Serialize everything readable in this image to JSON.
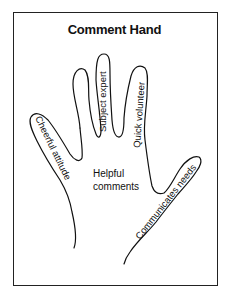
{
  "title": "Comment Hand",
  "palm_label": [
    "Helpful",
    "comments"
  ],
  "fingers": [
    {
      "id": "thumb",
      "label": "Cheerful attitude"
    },
    {
      "id": "index",
      "label": "Subject expert"
    },
    {
      "id": "middle",
      "label": "Quick volunteer"
    },
    {
      "id": "pinky",
      "label": "Communicates needs"
    }
  ],
  "colors": {
    "line": "#111111",
    "background": "#ffffff"
  }
}
